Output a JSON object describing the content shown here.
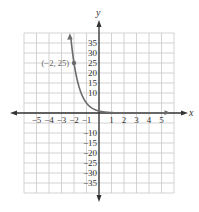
{
  "chart_data": {
    "type": "line",
    "title": "",
    "function": "y = 5^(-x)",
    "xlabel": "x",
    "ylabel": "y",
    "xlim": [
      -6,
      6
    ],
    "ylim": [
      -40,
      40
    ],
    "grid": true,
    "x_ticks": [
      -5,
      -4,
      -3,
      -2,
      -1,
      1,
      2,
      3,
      4,
      5
    ],
    "x_tick_labels": [
      "−5",
      "−4",
      "−3",
      "−2",
      "−1",
      "1",
      "2",
      "3",
      "4",
      "5"
    ],
    "y_ticks": [
      35,
      30,
      25,
      20,
      15,
      10,
      -10,
      -15,
      -20,
      -25,
      -30,
      -35
    ],
    "y_tick_labels": [
      "35",
      "30",
      "25",
      "20",
      "15",
      "10",
      "−10",
      "−15",
      "−20",
      "−25",
      "−30",
      "−35"
    ],
    "series": [
      {
        "name": "exponential curve",
        "x": [
          -2.25,
          -2,
          -1.5,
          -1,
          -0.5,
          0,
          1,
          2,
          3,
          4,
          5.6
        ],
        "y": [
          37.3,
          25,
          11.2,
          5,
          2.24,
          1,
          0.2,
          0.04,
          0.008,
          0.0016,
          0.0001
        ]
      }
    ],
    "annotations": [
      {
        "x": -2,
        "y": 25,
        "label": "(−2, 25)"
      }
    ],
    "colors": {
      "grid": "#c8c8c8",
      "axis": "#333333",
      "curve": "#6b6b6b",
      "point": "#6b6b6b"
    }
  }
}
